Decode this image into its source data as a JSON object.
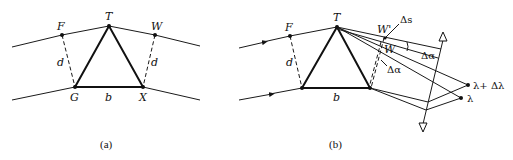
{
  "figure": {
    "panel_a": {
      "caption": "(a)",
      "labels": {
        "F": "F",
        "T": "T",
        "W": "W",
        "G": "G",
        "X": "X",
        "b": "b",
        "d_left": "d",
        "d_right": "d"
      }
    },
    "panel_b": {
      "caption": "(b)",
      "labels": {
        "F": "F",
        "T": "T",
        "W_prime": "W'",
        "W": "W",
        "delta_s": "Δs",
        "delta_alpha_small": "Δα",
        "delta_alpha_angle": "Δα",
        "b": "b",
        "d": "d",
        "lambda": "λ",
        "lambda_plus": "λ+ Δλ"
      }
    }
  }
}
